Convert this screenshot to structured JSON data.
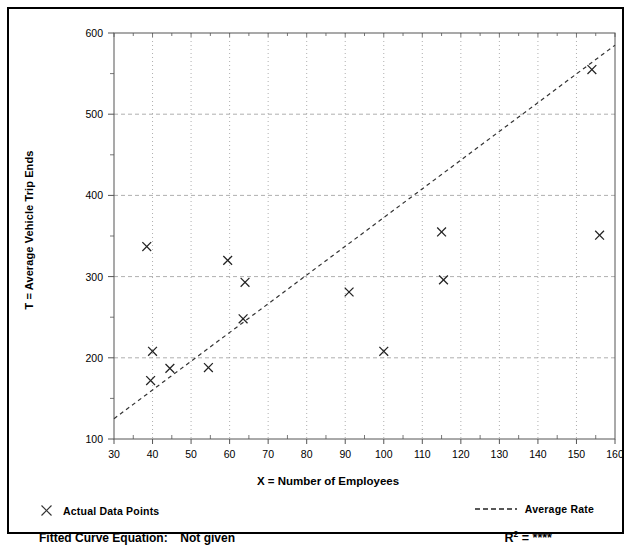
{
  "chart_data": {
    "type": "scatter",
    "title": "",
    "xlabel": "X = Number of Employees",
    "ylabel": "T = Average Vehicle Trip Ends",
    "xlim": [
      30,
      160
    ],
    "ylim": [
      100,
      600
    ],
    "xticks": [
      30,
      40,
      50,
      60,
      70,
      80,
      90,
      100,
      110,
      120,
      130,
      140,
      150,
      160
    ],
    "yticks": [
      100,
      200,
      300,
      400,
      500,
      600
    ],
    "yminorticks": [
      150,
      250,
      350,
      450,
      550
    ],
    "grid": true,
    "legend_position": "below-axes",
    "series": [
      {
        "name": "Actual Data Points",
        "type": "scatter",
        "marker": "x",
        "color": "#222222",
        "points": [
          {
            "x": 38.5,
            "y": 337
          },
          {
            "x": 40.0,
            "y": 208
          },
          {
            "x": 39.5,
            "y": 172
          },
          {
            "x": 44.5,
            "y": 187
          },
          {
            "x": 54.5,
            "y": 188
          },
          {
            "x": 59.5,
            "y": 320
          },
          {
            "x": 64.0,
            "y": 293
          },
          {
            "x": 63.5,
            "y": 248
          },
          {
            "x": 91.0,
            "y": 281
          },
          {
            "x": 100.0,
            "y": 208
          },
          {
            "x": 115.0,
            "y": 355
          },
          {
            "x": 115.5,
            "y": 296
          },
          {
            "x": 154.0,
            "y": 555
          },
          {
            "x": 156.0,
            "y": 351
          }
        ]
      },
      {
        "name": "Average Rate",
        "type": "line",
        "style": "dashed",
        "color": "#333333",
        "x": [
          30,
          160
        ],
        "y": [
          125,
          585
        ]
      }
    ]
  },
  "legend": {
    "actual_points_label": "Actual Data Points",
    "average_rate_label": "Average Rate",
    "marker_icon": "x-marker-icon",
    "line_icon": "dashed-line-icon"
  },
  "footer": {
    "fitted_curve_label": "Fitted Curve Equation:",
    "fitted_curve_value": "Not given",
    "r2_label": "R",
    "r2_exponent": "2",
    "r2_equals": "=",
    "r2_value": "****"
  },
  "axis": {
    "x_title": "X = Number of Employees",
    "y_title": "T = Average Vehicle Trip Ends",
    "x_tick_labels": [
      "30",
      "40",
      "50",
      "60",
      "70",
      "80",
      "90",
      "100",
      "110",
      "120",
      "130",
      "140",
      "150",
      "160"
    ],
    "y_tick_labels": [
      "100",
      "200",
      "300",
      "400",
      "500",
      "600"
    ]
  },
  "colors": {
    "frame": "#000000",
    "axis": "#555555",
    "grid": "#9a9a9a",
    "marker": "#222222",
    "trend": "#333333",
    "background": "#ffffff"
  }
}
